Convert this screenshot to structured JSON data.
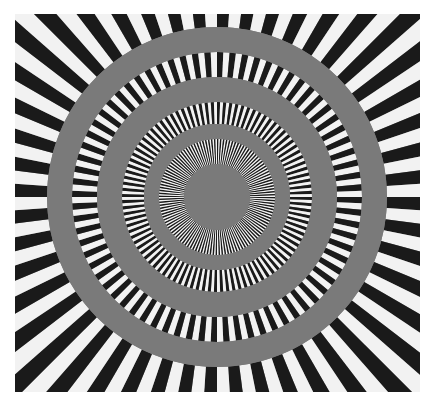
{
  "image": {
    "description": "Siemens star resolution test pattern with concentric spoke rings separated by gray bands",
    "background_color": "#ffffff",
    "gray_color": "#7a7a7a",
    "dark_color": "#1a1a1a",
    "light_color": "#f2f2f2",
    "center": [
      202,
      183
    ],
    "rings": [
      {
        "name": "outer-spoke-ring",
        "inner_radius": 170,
        "outer_radius": 300,
        "spokes": 96
      },
      {
        "name": "ring-2",
        "inner_radius": 120,
        "outer_radius": 145,
        "spokes": 144
      },
      {
        "name": "ring-3",
        "inner_radius": 73,
        "outer_radius": 95,
        "spokes": 192
      },
      {
        "name": "inner-ring",
        "inner_radius": 33,
        "outer_radius": 58,
        "spokes": 240
      }
    ],
    "gray_bands": [
      {
        "inner_radius": 145,
        "outer_radius": 170
      },
      {
        "inner_radius": 95,
        "outer_radius": 120
      },
      {
        "inner_radius": 58,
        "outer_radius": 73
      }
    ],
    "center_disk_radius": 33
  }
}
